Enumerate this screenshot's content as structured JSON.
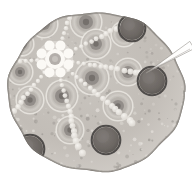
{
  "figure": {
    "kind": "light-micrograph",
    "canvas": {
      "width": 192,
      "height": 181,
      "background": "#ffffff"
    },
    "palette": {
      "background": "#ffffff",
      "tissue_light": "#d8d4cf",
      "tissue_mid": "#b9b4ae",
      "tissue_dark": "#8e8a85",
      "cell_wall": "#efece7",
      "bead_highlight": "#f4f1ec",
      "rosette_white": "#fbf9f5",
      "dark_circle_fill": "#6f6a66",
      "dark_circle_rim": "#4a4643",
      "edge_band": "#7e7a75",
      "needle": "#fdfcfa",
      "needle_edge": "#8d8984"
    },
    "specimen": {
      "shape": "ellipse",
      "center_x": 96,
      "center_y": 92,
      "radius_x": 88,
      "radius_y": 80,
      "flat_top_y": 12
    },
    "center_rosette": {
      "label": "central rosette",
      "center_x": 55,
      "center_y": 59,
      "outer_radius": 17,
      "petal_count": 8,
      "petal_radius": 5,
      "ring_outer_radius": 10,
      "ring_inner_radius": 6,
      "core_tone": "#b3aeaa"
    },
    "radial_bead_chains": {
      "label": "radiating bead chains",
      "count": 7,
      "bead_radius": 2.6,
      "beads_per_chain": 16,
      "start_radius": 18,
      "end_radius": 104,
      "angles_deg": [
        -72,
        -28,
        10,
        42,
        76,
        126,
        176
      ]
    },
    "ringed_cells": {
      "label": "concentric ringed cells",
      "items": [
        {
          "cx": 44,
          "cy": 24,
          "r": 13,
          "core": 6
        },
        {
          "cx": 86,
          "cy": 22,
          "r": 15,
          "core": 7
        },
        {
          "cx": 22,
          "cy": 44,
          "r": 11,
          "core": 5
        },
        {
          "cx": 20,
          "cy": 72,
          "r": 12,
          "core": 5
        },
        {
          "cx": 30,
          "cy": 100,
          "r": 13,
          "core": 6
        },
        {
          "cx": 62,
          "cy": 96,
          "r": 15,
          "core": 7
        },
        {
          "cx": 92,
          "cy": 78,
          "r": 16,
          "core": 7
        },
        {
          "cx": 96,
          "cy": 44,
          "r": 14,
          "core": 6
        },
        {
          "cx": 124,
          "cy": 34,
          "r": 12,
          "core": 5
        },
        {
          "cx": 128,
          "cy": 72,
          "r": 13,
          "core": 6
        },
        {
          "cx": 118,
          "cy": 106,
          "r": 14,
          "core": 6
        },
        {
          "cx": 70,
          "cy": 130,
          "r": 13,
          "core": 6
        },
        {
          "cx": 58,
          "cy": 58,
          "r": 0,
          "core": 0
        }
      ]
    },
    "dark_circles": {
      "label": "dark rimmed bodies",
      "items": [
        {
          "cx": 132,
          "cy": 28,
          "r": 12,
          "name": "dark-body-top-right"
        },
        {
          "cx": 152,
          "cy": 81,
          "r": 13,
          "name": "dark-body-right"
        },
        {
          "cx": 106,
          "cy": 140,
          "r": 13,
          "name": "dark-body-bottom-center"
        },
        {
          "cx": 30,
          "cy": 149,
          "r": 13,
          "name": "dark-body-bottom-left"
        }
      ]
    },
    "pointer_needle": {
      "label": "needle pointer",
      "tip_x": 146,
      "tip_y": 73,
      "tail_x": 192,
      "tail_y": 45,
      "width": 3.2
    },
    "grain": {
      "label": "granular texture",
      "dot_count": 520,
      "seed": 20240517
    }
  }
}
